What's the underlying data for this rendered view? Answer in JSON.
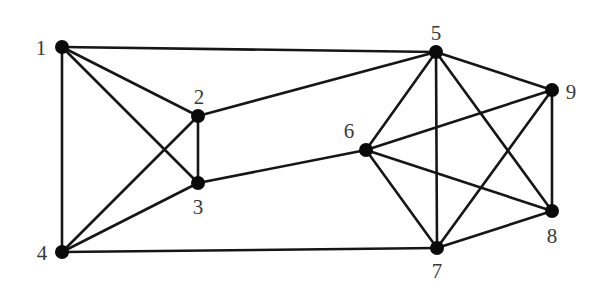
{
  "diagram": {
    "type": "undirected-graph",
    "nodes": [
      {
        "id": "1",
        "label": "1",
        "x": 62,
        "y": 47,
        "label_x": 41,
        "label_y": 48
      },
      {
        "id": "2",
        "label": "2",
        "x": 198,
        "y": 116,
        "label_x": 199,
        "label_y": 97
      },
      {
        "id": "3",
        "label": "3",
        "x": 198,
        "y": 183,
        "label_x": 198,
        "label_y": 207
      },
      {
        "id": "4",
        "label": "4",
        "x": 62,
        "y": 252,
        "label_x": 42,
        "label_y": 253
      },
      {
        "id": "5",
        "label": "5",
        "x": 436,
        "y": 52,
        "label_x": 436,
        "label_y": 33
      },
      {
        "id": "6",
        "label": "6",
        "x": 366,
        "y": 150,
        "label_x": 349,
        "label_y": 131
      },
      {
        "id": "7",
        "label": "7",
        "x": 437,
        "y": 248,
        "label_x": 437,
        "label_y": 271
      },
      {
        "id": "8",
        "label": "8",
        "x": 552,
        "y": 211,
        "label_x": 552,
        "label_y": 236
      },
      {
        "id": "9",
        "label": "9",
        "x": 552,
        "y": 90,
        "label_x": 571,
        "label_y": 92
      }
    ],
    "edges": [
      [
        "1",
        "5"
      ],
      [
        "1",
        "2"
      ],
      [
        "1",
        "3"
      ],
      [
        "1",
        "4"
      ],
      [
        "2",
        "3"
      ],
      [
        "2",
        "4"
      ],
      [
        "2",
        "5"
      ],
      [
        "3",
        "4"
      ],
      [
        "3",
        "6"
      ],
      [
        "4",
        "7"
      ],
      [
        "5",
        "6"
      ],
      [
        "5",
        "7"
      ],
      [
        "5",
        "8"
      ],
      [
        "5",
        "9"
      ],
      [
        "6",
        "7"
      ],
      [
        "6",
        "8"
      ],
      [
        "6",
        "9"
      ],
      [
        "7",
        "8"
      ],
      [
        "7",
        "9"
      ],
      [
        "8",
        "9"
      ]
    ],
    "style": {
      "node_color": "#0a0a0a",
      "edge_color": "#161616",
      "label_color": "#3a3a3a",
      "node_radius": 7
    }
  }
}
